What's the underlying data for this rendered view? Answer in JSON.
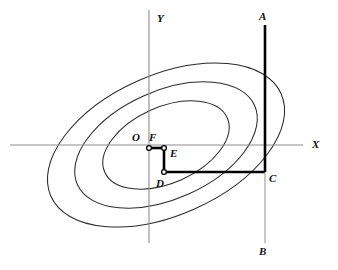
{
  "figure": {
    "background_color": "#ffffff",
    "width": 338,
    "height": 270
  },
  "axes": {
    "x_axis": {
      "label": "X",
      "label_x": 312,
      "label_y": 148,
      "x1": 10,
      "y1": 145,
      "x2": 303,
      "y2": 145,
      "color": "#8d8d8d"
    },
    "y_axis": {
      "label": "Y",
      "label_x": 157,
      "label_y": 22,
      "x1": 149,
      "y1": 10,
      "x2": 149,
      "y2": 243,
      "color": "#8d8d8d"
    },
    "origin_label": "O",
    "origin_label_x": 132,
    "origin_label_y": 141
  },
  "contours": {
    "color": "#2b2b2b",
    "center_x": 166,
    "center_y": 145,
    "rotation_deg": -24,
    "ellipses": [
      {
        "name": "inner-contour",
        "rx": 67,
        "ry": 38
      },
      {
        "name": "middle-contour",
        "rx": 97,
        "ry": 54
      },
      {
        "name": "outer-contour",
        "rx": 126,
        "ry": 70
      }
    ]
  },
  "path": {
    "thick_color": "#000000",
    "thin_color": "#9a9a9a",
    "segments": [
      {
        "name": "segment-A-to-C",
        "x1": 265,
        "y1": 25,
        "x2": 265,
        "y2": 172,
        "weight": "thick"
      },
      {
        "name": "segment-C-to-D",
        "x1": 265,
        "y1": 172,
        "x2": 164,
        "y2": 172,
        "weight": "thick"
      },
      {
        "name": "segment-D-to-E",
        "x1": 164,
        "y1": 172,
        "x2": 164,
        "y2": 148,
        "weight": "thick"
      },
      {
        "name": "segment-E-to-F",
        "x1": 164,
        "y1": 148,
        "x2": 149,
        "y2": 148,
        "weight": "thick"
      },
      {
        "name": "segment-C-to-B",
        "x1": 265,
        "y1": 172,
        "x2": 265,
        "y2": 243,
        "weight": "thin"
      }
    ]
  },
  "points": [
    {
      "name": "point-A",
      "label": "A",
      "x": 265,
      "y": 25,
      "label_x": 259,
      "label_y": 20,
      "marker": false
    },
    {
      "name": "point-B",
      "label": "B",
      "x": 265,
      "y": 243,
      "label_x": 259,
      "label_y": 255,
      "marker": false
    },
    {
      "name": "point-C",
      "label": "C",
      "x": 265,
      "y": 172,
      "label_x": 269,
      "label_y": 182,
      "marker": false
    },
    {
      "name": "point-D",
      "label": "D",
      "x": 164,
      "y": 172,
      "label_x": 156,
      "label_y": 187,
      "marker": true
    },
    {
      "name": "point-E",
      "label": "E",
      "x": 164,
      "y": 148,
      "label_x": 170,
      "label_y": 157,
      "marker": true
    },
    {
      "name": "point-F",
      "label": "F",
      "x": 149,
      "y": 148,
      "label_x": 149,
      "label_y": 141,
      "marker": true
    }
  ]
}
